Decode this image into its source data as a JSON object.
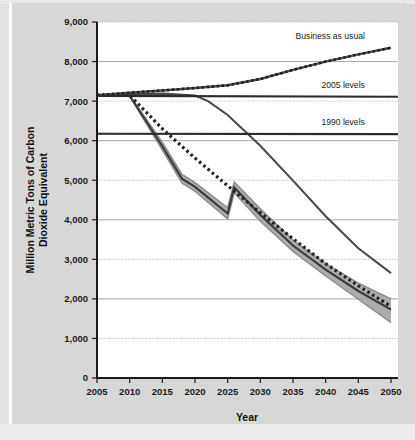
{
  "chart_data": {
    "type": "line",
    "title": "",
    "xlabel": "Year",
    "ylabel": "Million Metric Tons of Carbon Dioxide Equivalent",
    "xlim": [
      2005,
      2050
    ],
    "ylim": [
      0,
      9000
    ],
    "xticks": [
      2005,
      2010,
      2015,
      2020,
      2025,
      2030,
      2035,
      2040,
      2045,
      2050
    ],
    "xtick_labels": [
      "2005",
      "2010",
      "2015",
      "2020",
      "2025",
      "2030",
      "2035",
      "2040",
      "2045",
      "2050"
    ],
    "yticks": [
      0,
      1000,
      2000,
      3000,
      4000,
      5000,
      6000,
      7000,
      8000,
      9000
    ],
    "ytick_labels": [
      "0",
      "1,000",
      "2,000",
      "3,000",
      "4,000",
      "5,000",
      "6,000",
      "7,000",
      "8,000",
      "9,000"
    ],
    "grid": true,
    "grid_axis": "y",
    "legend_position": "inline-annotations",
    "annotations": [
      {
        "label": "Business as usual",
        "x": 2046,
        "y": 8580
      },
      {
        "label": "2005 levels",
        "x": 2046,
        "y": 7330
      },
      {
        "label": "1990 levels",
        "x": 2046,
        "y": 6400
      }
    ],
    "series": [
      {
        "name": "Business as usual",
        "style": "dotted-over-solid",
        "color": "#3a3a3a",
        "x": [
          2005,
          2010,
          2015,
          2020,
          2025,
          2030,
          2035,
          2040,
          2045,
          2050
        ],
        "values": [
          7150,
          7210,
          7270,
          7330,
          7400,
          7560,
          7790,
          8000,
          8180,
          8350
        ]
      },
      {
        "name": "2005 levels",
        "style": "solid-reference",
        "color": "#2b2b2b",
        "x": [
          2005,
          2050
        ],
        "values": [
          7130,
          7110
        ]
      },
      {
        "name": "1990 levels",
        "style": "solid-reference",
        "color": "#2b2b2b",
        "x": [
          2005,
          2050
        ],
        "values": [
          6175,
          6165
        ]
      },
      {
        "name": "Gradual reduction pathway",
        "style": "solid",
        "color": "#4a4a4a",
        "x": [
          2005,
          2010,
          2015,
          2020,
          2022,
          2025,
          2030,
          2035,
          2040,
          2045,
          2050
        ],
        "values": [
          7150,
          7180,
          7190,
          7140,
          7000,
          6650,
          5870,
          4990,
          4090,
          3280,
          2650
        ]
      },
      {
        "name": "Accelerated reduction pathway",
        "style": "dotted",
        "color": "#222222",
        "x": [
          2005,
          2010,
          2015,
          2020,
          2025,
          2030,
          2035,
          2040,
          2045,
          2050
        ],
        "values": [
          7150,
          7150,
          6300,
          5560,
          4860,
          4180,
          3520,
          2890,
          2330,
          1810
        ]
      },
      {
        "name": "Modeled range (band) - upper bound",
        "style": "band-upper",
        "color": "#9a9a9a",
        "x": [
          2005,
          2010,
          2015,
          2018,
          2020,
          2025,
          2026,
          2030,
          2035,
          2040,
          2045,
          2050
        ],
        "values": [
          7160,
          7150,
          5960,
          5150,
          4940,
          4300,
          4960,
          4280,
          3490,
          2890,
          2400,
          2000
        ]
      },
      {
        "name": "Modeled range (band) - lower bound",
        "style": "band-lower",
        "color": "#9a9a9a",
        "x": [
          2005,
          2010,
          2015,
          2018,
          2020,
          2025,
          2026,
          2030,
          2035,
          2040,
          2045,
          2050
        ],
        "values": [
          7140,
          7120,
          5760,
          4930,
          4720,
          4020,
          4680,
          3960,
          3200,
          2580,
          1990,
          1400
        ]
      },
      {
        "name": "Modeled range (band) - central estimate",
        "style": "solid-dark",
        "color": "#3a3a3a",
        "x": [
          2005,
          2010,
          2015,
          2018,
          2020,
          2025,
          2026,
          2030,
          2035,
          2040,
          2045,
          2050
        ],
        "values": [
          7150,
          7135,
          5860,
          5040,
          4830,
          4160,
          4820,
          4120,
          3350,
          2740,
          2200,
          1730
        ]
      }
    ],
    "colors": {
      "page_background": "#d7d7d7",
      "plot_background": "#ffffff",
      "axis": "#1a1a1a",
      "gridline": "#9f9f9f",
      "band_fill": "#a8a8a8",
      "reference_line": "#2b2b2b"
    }
  },
  "axis_titles": {
    "x": "Year",
    "y": "Million Metric Tons of Carbon Dioxide Equivalent"
  }
}
